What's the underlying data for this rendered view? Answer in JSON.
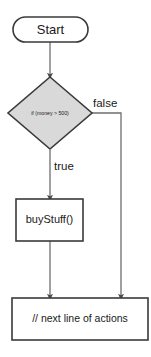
{
  "diagram": {
    "colors": {
      "background": "#ffffff",
      "shape_stroke": "#3a3a3a",
      "connector": "#6e6e6e",
      "decision_fill": "#d9d9d9",
      "process_fill": "#ffffff",
      "text": "#1a1a1a"
    },
    "nodes": {
      "start": {
        "label": "Start",
        "shape": "terminator",
        "fill": "#ffffff"
      },
      "decision": {
        "label": "if (money > 500)",
        "shape": "diamond",
        "fill": "#d9d9d9"
      },
      "process": {
        "label": "buyStuff()",
        "shape": "rectangle",
        "fill": "#ffffff"
      },
      "next": {
        "label": "// next line of actions",
        "shape": "rectangle",
        "fill": "#ffffff"
      }
    },
    "edges": {
      "start_to_decision": {
        "label": ""
      },
      "decision_true": {
        "label": "true"
      },
      "decision_false": {
        "label": "false"
      },
      "process_to_next": {
        "label": ""
      }
    }
  }
}
